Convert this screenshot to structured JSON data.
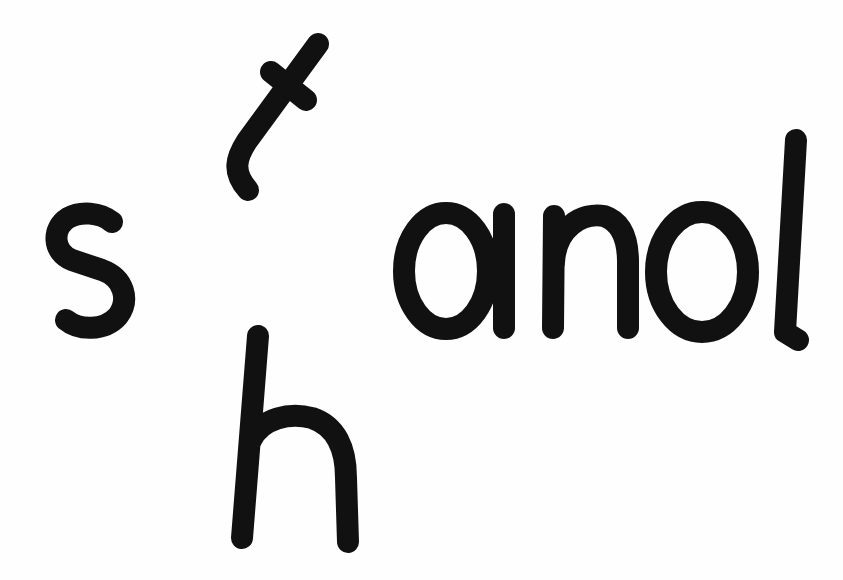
{
  "card": {
    "description": "Word-building letter tiles",
    "tiles": [
      {
        "id": "s",
        "text": "s",
        "rotation_deg": 0
      },
      {
        "id": "t",
        "text": "t",
        "rotation_deg": 35
      },
      {
        "id": "and",
        "text": "and",
        "rotation_deg": 0
      },
      {
        "id": "h",
        "text": "h",
        "rotation_deg": 4
      }
    ],
    "ink_color": "#111111",
    "background_color": "#fefefe"
  }
}
